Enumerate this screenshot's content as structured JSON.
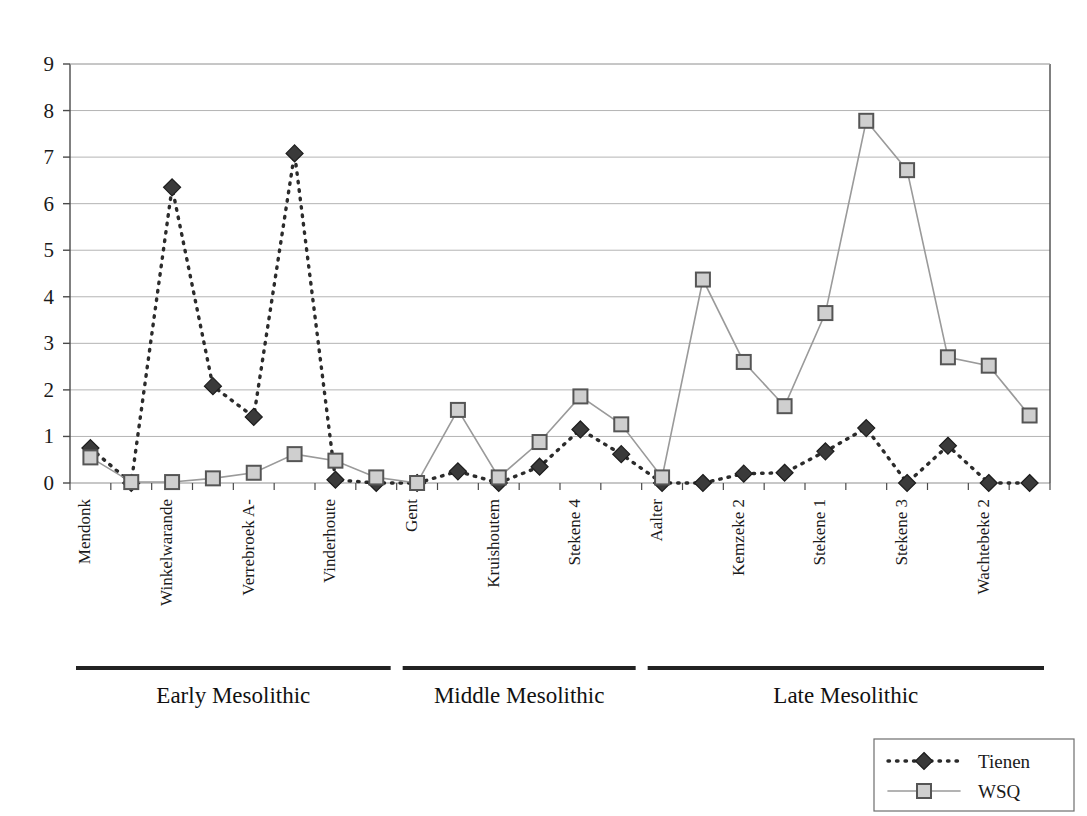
{
  "chart_data": {
    "type": "line",
    "title": "",
    "xlabel": "",
    "ylabel": "",
    "ylim": [
      0,
      9
    ],
    "yticks": [
      0,
      1,
      2,
      3,
      4,
      5,
      6,
      7,
      8,
      9
    ],
    "grid": true,
    "legend_position": "bottom-right",
    "categories": [
      "Mendonk",
      "",
      "Winkelwarande",
      "",
      "Verrebroek A-",
      "",
      "Vinderhoute",
      "",
      "Gent",
      "",
      "Kruishoutem",
      "",
      "Stekene 4",
      "",
      "Aalter",
      "",
      "Kemzeke 2",
      "",
      "Stekene 1",
      "",
      "Stekene 3",
      "",
      "Wachtebeke 2",
      ""
    ],
    "visible_tick_labels": [
      "Mendonk",
      "Winkelwarande",
      "Verrebroek A-",
      "Vinderhoute",
      "Gent",
      "Kruishoutem",
      "Stekene 4",
      "Aalter",
      "Kemzeke 2",
      "Stekene 1",
      "Stekene 3",
      "Wachtebeke 2"
    ],
    "series": [
      {
        "name": "Tienen",
        "color": "#2b2b2b",
        "linestyle": "dashed",
        "marker": "diamond",
        "values": [
          0.75,
          0.0,
          6.35,
          2.08,
          1.42,
          7.08,
          0.07,
          0.0,
          0.0,
          0.25,
          0.0,
          0.35,
          1.15,
          0.62,
          0.0,
          0.0,
          0.2,
          0.22,
          0.68,
          1.18,
          0.0,
          0.8,
          0.0,
          0.0
        ]
      },
      {
        "name": "WSQ",
        "color": "#9a9a9a",
        "linestyle": "solid",
        "marker": "square",
        "values": [
          0.55,
          0.02,
          0.02,
          0.1,
          0.22,
          0.62,
          0.48,
          0.12,
          0.0,
          1.57,
          0.12,
          0.88,
          1.86,
          1.26,
          0.12,
          4.37,
          2.6,
          1.65,
          3.65,
          7.78,
          6.72,
          2.7,
          2.52,
          1.45
        ]
      }
    ],
    "groups": [
      {
        "label": "Early Mesolithic",
        "start_index": 0,
        "end_index": 7
      },
      {
        "label": "Middle Mesolithic",
        "start_index": 8,
        "end_index": 13
      },
      {
        "label": "Late Mesolithic",
        "start_index": 14,
        "end_index": 23
      }
    ]
  },
  "legend": {
    "items": [
      {
        "label": "Tienen",
        "marker": "diamond-marker",
        "line": "dashed"
      },
      {
        "label": "WSQ",
        "marker": "square-marker",
        "line": "solid"
      }
    ]
  },
  "colors": {
    "tienen": "#2b2b2b",
    "wsq": "#9a9a9a",
    "grid": "#b4b4b4",
    "axis": "#4a4a4a",
    "background": "#ffffff"
  }
}
